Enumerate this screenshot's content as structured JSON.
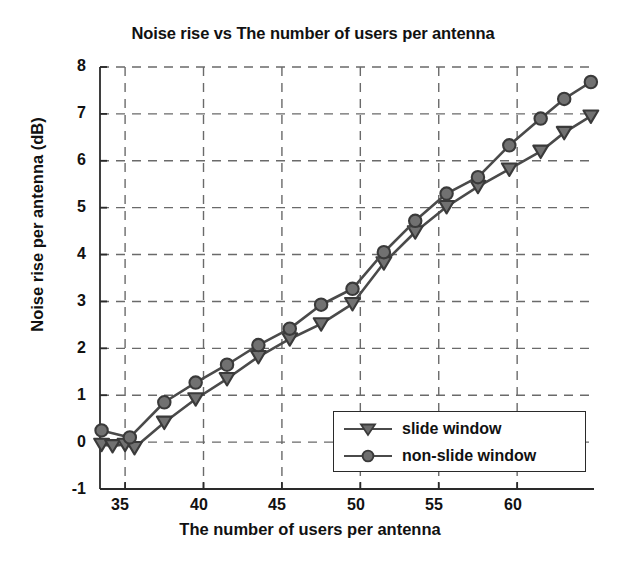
{
  "chart_data": {
    "type": "line",
    "title": "Noise rise vs The number of users per antenna",
    "xlabel": "The number of users per antenna",
    "ylabel": "Noise rise per antenna (dB)",
    "xlim": [
      33.4,
      64.9
    ],
    "ylim": [
      -1,
      8
    ],
    "xticks": [
      35,
      40,
      45,
      50,
      55,
      60
    ],
    "yticks": [
      -1,
      0,
      1,
      2,
      3,
      4,
      5,
      6,
      7,
      8
    ],
    "grid": true,
    "grid_style": "dashed",
    "legend_position": "lower right",
    "line_color": "#4a4a4a",
    "series": [
      {
        "name": "slide window",
        "marker": "triangle-down",
        "x": [
          33.5,
          34.2,
          35.0,
          35.6,
          37.5,
          39.5,
          41.5,
          43.5,
          45.5,
          47.5,
          49.5,
          51.5,
          53.5,
          55.5,
          57.5,
          59.5,
          61.5,
          63.0,
          64.7
        ],
        "y": [
          -0.05,
          -0.08,
          -0.05,
          -0.12,
          0.42,
          0.92,
          1.35,
          1.82,
          2.2,
          2.52,
          2.95,
          3.82,
          4.48,
          5.02,
          5.45,
          5.82,
          6.2,
          6.6,
          6.95
        ]
      },
      {
        "name": "non-slide window",
        "marker": "circle",
        "x": [
          33.5,
          35.3,
          37.5,
          39.5,
          41.5,
          43.5,
          45.5,
          47.5,
          49.5,
          51.5,
          53.5,
          55.5,
          57.5,
          59.5,
          61.5,
          63.0,
          64.7
        ],
        "y": [
          0.25,
          0.1,
          0.85,
          1.27,
          1.65,
          2.07,
          2.42,
          2.93,
          3.27,
          4.05,
          4.72,
          5.3,
          5.65,
          6.33,
          6.9,
          7.32,
          7.68
        ]
      }
    ]
  },
  "ticks": {
    "y": [
      "8",
      "7",
      "6",
      "5",
      "4",
      "3",
      "2",
      "1",
      "0",
      "-1"
    ],
    "x": [
      "35",
      "40",
      "45",
      "50",
      "55",
      "60"
    ]
  },
  "legend": {
    "items": [
      {
        "label": "slide window",
        "marker": "triangle-down-icon"
      },
      {
        "label": "non-slide window",
        "marker": "circle-icon"
      }
    ]
  }
}
